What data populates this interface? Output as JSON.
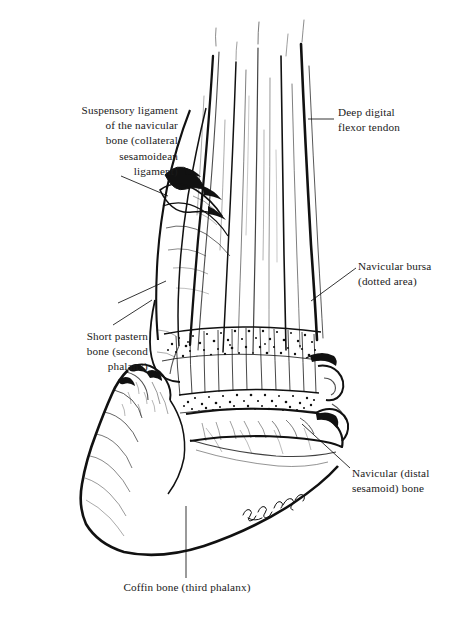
{
  "figure": {
    "background_color": "#ffffff",
    "ink_color": "#111111",
    "signature": "artist signature (cursive, lower right of coffin bone)"
  },
  "labels": {
    "suspensory_ligament": "Suspensory ligament\nof the navicular\nbone (collateral\nsesamoidean\nligament)",
    "short_pastern": "Short pastern\nbone (second\nphalanx)",
    "coffin_bone": "Coffin bone (third phalanx)",
    "deep_digital_flexor_tendon": "Deep digital\nflexor tendon",
    "navicular_bursa": "Navicular bursa\n(dotted area)",
    "navicular_bone": "Navicular (distal\nsesamoid) bone"
  },
  "leaders": {
    "suspensory_upper": "line from suspensory label to ligament fold",
    "suspensory_lower": "line from suspensory label to lower ligament",
    "short_pastern": "diagonal line up-right to pastern bone",
    "coffin_bone": "vertical line up to coffin bone",
    "deep_digital_flexor_tendon": "horizontal dash left to tendon",
    "navicular_bursa": "diagonal line down-left to stippled bursa",
    "navicular_bone": "diagonal line down-left to navicular bone"
  }
}
